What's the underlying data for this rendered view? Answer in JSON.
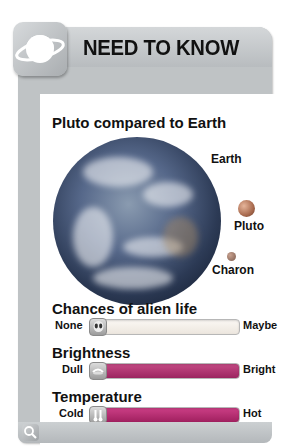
{
  "header": {
    "title": "NEED TO KNOW",
    "icon": "planet-ringed-icon"
  },
  "comparison": {
    "title": "Pluto compared to Earth",
    "bodies": [
      {
        "name": "Earth"
      },
      {
        "name": "Pluto"
      },
      {
        "name": "Charon"
      }
    ]
  },
  "meters": [
    {
      "title": "Chances of alien life",
      "min_label": "None",
      "max_label": "Maybe",
      "icon": "alien-icon",
      "fill_color": "#f4efe8",
      "value_pct": 0
    },
    {
      "title": "Brightness",
      "min_label": "Dull",
      "max_label": "Bright",
      "icon": "dim-light-icon",
      "fill_color": "#b0306a",
      "value_pct": 0
    },
    {
      "title": "Temperature",
      "min_label": "Cold",
      "max_label": "Hot",
      "icon": "thermometer-icon",
      "fill_color": "#c2287a",
      "value_pct": 0
    }
  ],
  "footer": {
    "icon": "magnifier-icon"
  },
  "colors": {
    "frame": "#bfc3c5",
    "meter_fill": "#c02a76"
  }
}
